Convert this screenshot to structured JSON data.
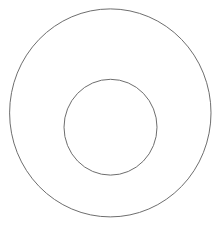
{
  "diagram": {
    "type": "nested-circles",
    "background": "#ffffff",
    "stroke_color": "#6e6e6e",
    "stroke_width": 1,
    "shapes": [
      {
        "name": "outer-circle",
        "cx": 110.3,
        "cy": 112.9,
        "rx": 100.7,
        "ry": 104.0
      },
      {
        "name": "inner-circle",
        "cx": 110.5,
        "cy": 127.2,
        "rx": 46.5,
        "ry": 47.9
      }
    ]
  }
}
